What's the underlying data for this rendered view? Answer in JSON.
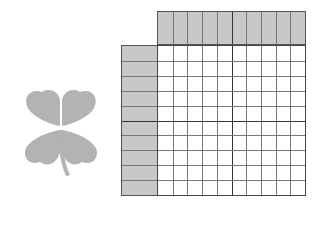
{
  "puzzle": {
    "type": "nonogram",
    "columns": 10,
    "rows": 10,
    "column_clues": [
      [],
      [],
      [],
      [],
      [],
      [],
      [],
      [],
      [],
      []
    ],
    "row_clues": [
      [],
      [],
      [],
      [],
      [],
      [],
      [],
      [],
      [],
      []
    ],
    "thick_divider_every": 5
  },
  "decoration": {
    "icon": "four-leaf-clover-icon",
    "color": "#b3b3b3"
  },
  "colors": {
    "clue_bg": "#c8c8c8",
    "grid_line": "#777777",
    "thick_line": "#333333",
    "cell_bg": "#ffffff"
  }
}
